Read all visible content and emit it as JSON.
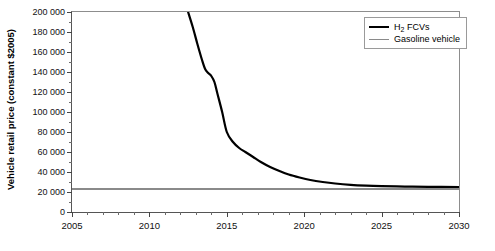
{
  "chart_data": {
    "type": "line",
    "title": "",
    "subtitle": "",
    "xlabel": "",
    "ylabel": "Vehicle retail price (constant $2005)",
    "xlim": [
      2005,
      2030
    ],
    "ylim": [
      0,
      200000
    ],
    "xticks": [
      2005,
      2010,
      2015,
      2020,
      2025,
      2030
    ],
    "xtick_labels": [
      "2005",
      "2010",
      "2015",
      "2020",
      "2025",
      "2030"
    ],
    "xtick_minor_step": 1,
    "yticks": [
      0,
      20000,
      40000,
      60000,
      80000,
      100000,
      120000,
      140000,
      160000,
      180000,
      200000
    ],
    "ytick_labels": [
      "0",
      "20 000",
      "40 000",
      "60 000",
      "80 000",
      "100 000",
      "120 000",
      "140 000",
      "160 000",
      "180 000",
      "200 000"
    ],
    "ytick_minor_step": 10000,
    "grid": false,
    "legend_position": "top-right",
    "legend": [
      "H2 FCVs",
      "Gasoline vehicle"
    ],
    "series": [
      {
        "name": "H2 FCVs",
        "name_html": "H<sub>2</sub> FCVs",
        "color": "#000000",
        "width": 2.2,
        "x": [
          2012.5,
          2012.8,
          2013.1,
          2013.4,
          2013.6,
          2013.8,
          2014.0,
          2014.2,
          2014.4,
          2014.7,
          2015.0,
          2015.4,
          2015.8,
          2016.2,
          2016.7,
          2017.2,
          2017.8,
          2018.4,
          2019.0,
          2019.7,
          2020.4,
          2021.2,
          2022.0,
          2023.0,
          2024.0,
          2025.0,
          2026.5,
          2028.0,
          2030.0
        ],
        "y": [
          200000,
          185000,
          168000,
          152000,
          143000,
          139000,
          136000,
          130000,
          118000,
          100000,
          80000,
          70000,
          64000,
          60000,
          55000,
          50000,
          45000,
          41000,
          37500,
          34500,
          32000,
          30000,
          28500,
          27200,
          26400,
          25900,
          25400,
          25100,
          25000
        ]
      },
      {
        "name": "Gasoline vehicle",
        "color": "#8a8a8a",
        "width": 1.8,
        "x": [
          2005,
          2030
        ],
        "y": [
          23000,
          23000
        ]
      }
    ]
  },
  "legend": {
    "items": [
      {
        "label_html": "H<sub>2</sub> FCVs",
        "label": "H2 FCVs",
        "color": "#000000"
      },
      {
        "label_html": "Gasoline vehicle",
        "label": "Gasoline vehicle",
        "color": "#8a8a8a"
      }
    ]
  },
  "axes": {
    "y_title": "Vehicle retail price (constant $2005)"
  },
  "colors": {
    "h2_line": "#000000",
    "gasoline_line": "#8a8a8a",
    "frame": "#555555",
    "background": "#ffffff"
  }
}
